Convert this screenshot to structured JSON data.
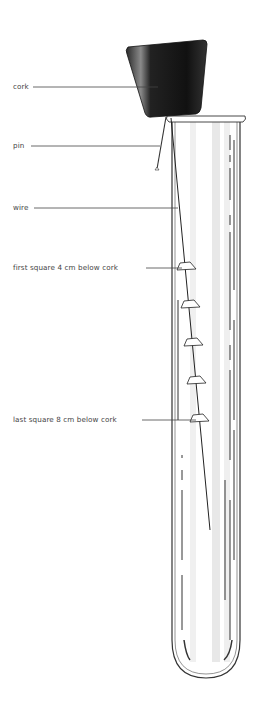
{
  "diagram": {
    "labels": [
      {
        "id": "cork",
        "text": "cork",
        "x": 13,
        "y": 83,
        "line": [
          33,
          87,
          158,
          87
        ]
      },
      {
        "id": "pin",
        "text": "pin",
        "x": 13,
        "y": 142,
        "line": [
          31,
          146,
          160,
          146
        ]
      },
      {
        "id": "wire",
        "text": "wire",
        "x": 13,
        "y": 204,
        "line": [
          34,
          208,
          178,
          208
        ]
      },
      {
        "id": "first-square",
        "text": "first square 4 cm below cork",
        "x": 13,
        "y": 264,
        "line": [
          146,
          268,
          182,
          268
        ]
      },
      {
        "id": "last-square",
        "text": "last square 8 cm below cork",
        "x": 13,
        "y": 416,
        "line": [
          142,
          420,
          196,
          420
        ]
      }
    ],
    "squares_count": 5,
    "colors": {
      "cork": "#1a1a1a",
      "line": "#444444",
      "tube_outline": "#333333",
      "glass_shade": "#e6e6e6"
    }
  }
}
